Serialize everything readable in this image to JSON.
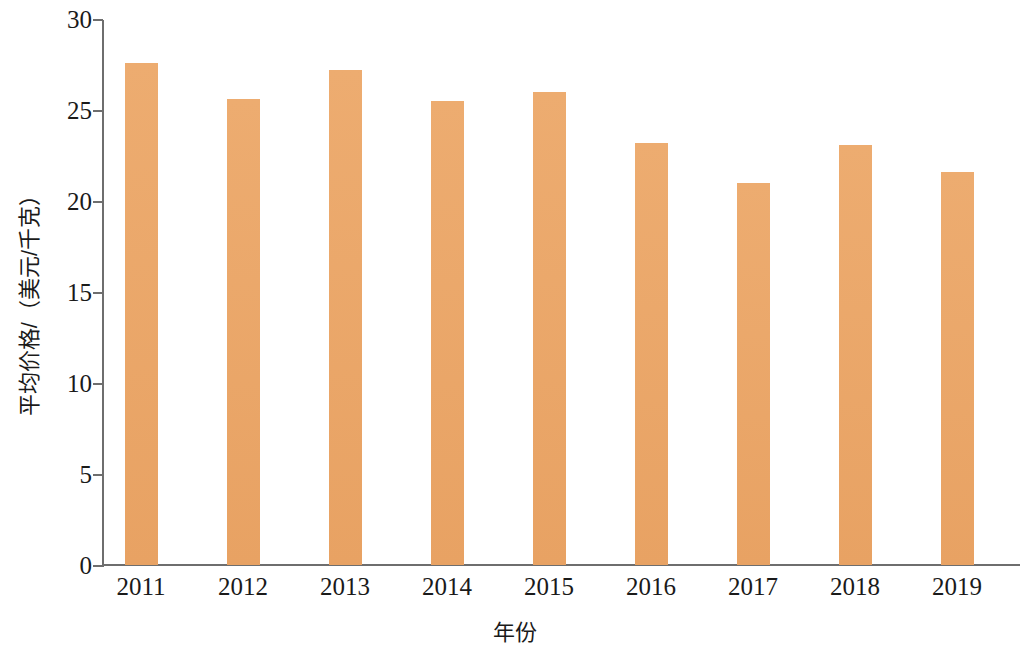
{
  "chart_data": {
    "type": "bar",
    "title": "",
    "subtitle": "",
    "xlabel": "年份",
    "ylabel": "平均价格/（美元/千克）",
    "categories": [
      "2011",
      "2012",
      "2013",
      "2014",
      "2015",
      "2016",
      "2017",
      "2018",
      "2019"
    ],
    "values": [
      27.6,
      25.6,
      27.2,
      25.5,
      26.0,
      23.2,
      21.0,
      23.1,
      21.6
    ],
    "series": [
      {
        "name": "平均价格",
        "values": [
          27.6,
          25.6,
          27.2,
          25.5,
          26.0,
          23.2,
          21.0,
          23.1,
          21.6
        ]
      }
    ],
    "ylim": [
      0,
      30
    ],
    "yticks": [
      0,
      5,
      10,
      15,
      20,
      25,
      30
    ],
    "ytick_labels": [
      "0",
      "5",
      "10",
      "15",
      "20",
      "25",
      "30"
    ],
    "xtick_labels": [
      "2011",
      "2012",
      "2013",
      "2014",
      "2015",
      "2016",
      "2017",
      "2018",
      "2019"
    ],
    "grid": false,
    "legend": false,
    "legend_position": "none",
    "bar_color": "#eba869",
    "axis_color": "#6e6e6e",
    "text_color": "#1a1a1a",
    "background_color": "#ffffff",
    "annotations": []
  }
}
